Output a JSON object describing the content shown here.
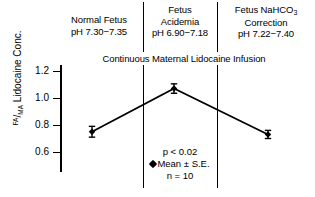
{
  "chart_data": {
    "type": "line",
    "title": "",
    "xlabel": "",
    "ylabel": "FA/MA Lidocaine Conc.",
    "ylim": [
      0.5,
      1.3
    ],
    "yticks": [
      1.2,
      1.0,
      0.8,
      0.6
    ],
    "ytick_labels": [
      "1.2",
      "1.0",
      "0.8",
      "0.6"
    ],
    "grid": false,
    "legend_position": "center-bottom",
    "categories": [
      "Normal Fetus",
      "Fetus Acidemia",
      "Fetus NaHCO3 Correction"
    ],
    "values": [
      0.75,
      1.07,
      0.73
    ],
    "errors": [
      0.04,
      0.035,
      0.03
    ],
    "series": [
      {
        "name": "Mean ± S.E.",
        "values": [
          0.75,
          1.07,
          0.73
        ],
        "errors": [
          0.04,
          0.035,
          0.03
        ]
      }
    ],
    "annotations": [
      "p < 0.02",
      "Mean ± S.E.",
      "n = 10"
    ],
    "panel_span_label": "Continuous Maternal Lidocaine Infusion",
    "marker": "filled-diamond",
    "line_color": "#000000",
    "marker_color": "#000000"
  },
  "axis": {
    "y_title_numerator": "FA",
    "y_title_slash": "/",
    "y_title_denominator": "MA",
    "y_title_text": " Lidocaine Conc.",
    "ticks": [
      {
        "label": "1.2",
        "value": 1.2
      },
      {
        "label": "1.0",
        "value": 1.0
      },
      {
        "label": "0.8",
        "value": 0.8
      },
      {
        "label": "0.6",
        "value": 0.6
      }
    ]
  },
  "headers": {
    "col0": {
      "line1": "Normal Fetus",
      "line2": "pH 7.30−7.35"
    },
    "col1": {
      "line1": "Fetus",
      "line2": "Acidemia",
      "line3": "pH 6.90−7.18"
    },
    "col2": {
      "line1_main": "Fetus NaHCO",
      "line1_sub": "3",
      "line2": "Correction",
      "line3": "pH 7.22−7.40"
    }
  },
  "infusion": {
    "label": "Continuous Maternal Lidocaine Infusion"
  },
  "annotation": {
    "p_value": "p < 0.02",
    "mean_legend": "Mean ± S.E.",
    "sample_size": "n = 10"
  }
}
